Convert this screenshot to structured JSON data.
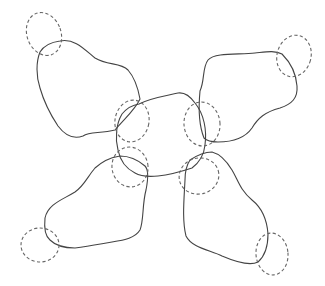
{
  "canvas": {
    "width": 325,
    "height": 286,
    "background": "#ffffff"
  },
  "colors": {
    "solid_stroke": "#444444",
    "dashed_stroke": "#666666"
  },
  "diagram": {
    "center_blob": {
      "name": "center-blob",
      "path": "M 139 104 C 150 98, 165 96, 178 93 C 185 92, 190 96, 195 103 C 204 114, 207 130, 205 145 C 204 155, 200 162, 192 168 C 180 172, 168 175, 158 176 C 148 177, 140 176, 135 173 C 125 168, 120 160, 118 150 C 115 138, 116 124, 122 114 C 127 108, 132 105, 139 104 Z"
    },
    "lobes": [
      {
        "name": "lobe-top-left",
        "path": "M 60 41 C 75 38, 85 50, 95 58 C 108 66, 120 62, 128 70 C 135 78, 138 88, 140 99 C 135 110, 125 118, 115 130 C 100 134, 90 131, 83 136 C 72 140, 64 134, 58 126 C 50 114, 44 102, 40 88 C 36 76, 36 62, 40 52 C 45 44, 52 42, 60 41 Z",
        "outer_loop": {
          "name": "dashed-loop-top-left-outer",
          "cx": 44,
          "cy": 34,
          "rx": 17,
          "ry": 22,
          "rotate": -20
        },
        "inner_loop": {
          "name": "dashed-loop-top-left-inner",
          "cx": 132,
          "cy": 121,
          "rx": 17,
          "ry": 21,
          "rotate": 10
        }
      },
      {
        "name": "lobe-top-right",
        "path": "M 200 91 C 205 80, 202 68, 208 60 C 215 52, 240 55, 255 53 C 265 52, 275 50, 282 54 C 290 62, 296 72, 297 86 C 298 98, 292 104, 280 108 C 265 112, 258 118, 252 128 C 245 138, 232 142, 218 142 C 210 142, 206 140, 204 138 C 200 128, 198 112, 200 91 Z",
        "outer_loop": {
          "name": "dashed-loop-top-right-outer",
          "cx": 294,
          "cy": 56,
          "rx": 17,
          "ry": 21,
          "rotate": 15
        },
        "inner_loop": {
          "name": "dashed-loop-top-right-inner",
          "cx": 202,
          "cy": 124,
          "rx": 18,
          "ry": 22,
          "rotate": -5
        }
      },
      {
        "name": "lobe-bottom-left",
        "path": "M 120 156 C 108 158, 102 162, 95 168 C 88 176, 84 186, 75 192 C 62 200, 48 204, 45 218 C 44 228, 45 236, 50 240 C 56 246, 64 248, 75 248 C 90 246, 100 244, 112 242 C 125 240, 135 238, 140 230 C 144 220, 142 205, 146 190 C 148 180, 149 170, 145 166 C 138 160, 128 156, 120 156 Z",
        "outer_loop": {
          "name": "dashed-loop-bottom-left-outer",
          "cx": 40,
          "cy": 245,
          "rx": 19,
          "ry": 17,
          "rotate": 0
        },
        "inner_loop": {
          "name": "dashed-loop-bottom-left-inner",
          "cx": 130,
          "cy": 167,
          "rx": 18,
          "ry": 20,
          "rotate": -10
        }
      },
      {
        "name": "lobe-bottom-right",
        "path": "M 185 180 C 184 200, 182 220, 186 236 C 192 248, 210 250, 222 256 C 236 262, 250 266, 258 262 C 265 256, 268 246, 268 234 C 267 220, 262 208, 252 200 C 240 190, 238 180, 232 170 C 226 160, 220 154, 212 152 C 204 152, 196 156, 190 160 C 186 166, 185 172, 185 180 Z",
        "outer_loop": {
          "name": "dashed-loop-bottom-right-outer",
          "cx": 272,
          "cy": 254,
          "rx": 16,
          "ry": 21,
          "rotate": -5
        },
        "inner_loop": {
          "name": "dashed-loop-bottom-right-inner",
          "cx": 199,
          "cy": 176,
          "rx": 20,
          "ry": 18,
          "rotate": -15
        }
      }
    ]
  }
}
